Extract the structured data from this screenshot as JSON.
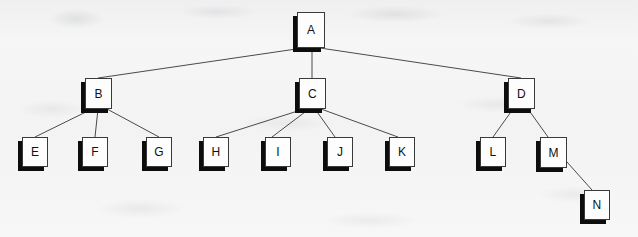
{
  "diagram": {
    "type": "node-link-tree",
    "canvas": {
      "width": 638,
      "height": 237
    },
    "style": {
      "background_color": "#f4f4f4",
      "node_fill": "#fdfdfd",
      "node_border": "#3a3a3a",
      "node_shadow": "#0d0d0d",
      "edge_color": "#4a4a4a",
      "label_color": "#111111"
    },
    "nodes": [
      {
        "id": "A",
        "label": "A",
        "x": 297,
        "y": 12,
        "w": 28,
        "h": 36,
        "level": 0
      },
      {
        "id": "B",
        "label": "B",
        "x": 85,
        "y": 78,
        "w": 27,
        "h": 31,
        "level": 1
      },
      {
        "id": "C",
        "label": "C",
        "x": 299,
        "y": 78,
        "w": 27,
        "h": 31,
        "level": 1
      },
      {
        "id": "D",
        "label": "D",
        "x": 508,
        "y": 78,
        "w": 27,
        "h": 31,
        "level": 1
      },
      {
        "id": "E",
        "label": "E",
        "x": 22,
        "y": 137,
        "w": 26,
        "h": 30,
        "level": 2
      },
      {
        "id": "F",
        "label": "F",
        "x": 82,
        "y": 137,
        "w": 26,
        "h": 30,
        "level": 2
      },
      {
        "id": "G",
        "label": "G",
        "x": 146,
        "y": 137,
        "w": 26,
        "h": 30,
        "level": 2
      },
      {
        "id": "H",
        "label": "H",
        "x": 203,
        "y": 137,
        "w": 26,
        "h": 30,
        "level": 2
      },
      {
        "id": "I",
        "label": "I",
        "x": 265,
        "y": 137,
        "w": 26,
        "h": 30,
        "level": 2
      },
      {
        "id": "J",
        "label": "J",
        "x": 327,
        "y": 137,
        "w": 26,
        "h": 30,
        "level": 2
      },
      {
        "id": "K",
        "label": "K",
        "x": 389,
        "y": 137,
        "w": 26,
        "h": 30,
        "level": 2
      },
      {
        "id": "L",
        "label": "L",
        "x": 480,
        "y": 137,
        "w": 26,
        "h": 30,
        "level": 2
      },
      {
        "id": "M",
        "label": "M",
        "x": 540,
        "y": 137,
        "w": 27,
        "h": 31,
        "level": 2
      },
      {
        "id": "N",
        "label": "N",
        "x": 584,
        "y": 190,
        "w": 26,
        "h": 30,
        "level": 3
      }
    ],
    "edges": [
      {
        "from": "A",
        "to": "B",
        "x1": 303,
        "y1": 48,
        "x2": 98,
        "y2": 78
      },
      {
        "from": "A",
        "to": "C",
        "x1": 312,
        "y1": 48,
        "x2": 312,
        "y2": 78
      },
      {
        "from": "A",
        "to": "D",
        "x1": 320,
        "y1": 48,
        "x2": 521,
        "y2": 78
      },
      {
        "from": "B",
        "to": "E",
        "x1": 92,
        "y1": 109,
        "x2": 35,
        "y2": 137
      },
      {
        "from": "B",
        "to": "F",
        "x1": 98,
        "y1": 109,
        "x2": 95,
        "y2": 137
      },
      {
        "from": "B",
        "to": "G",
        "x1": 107,
        "y1": 109,
        "x2": 159,
        "y2": 137
      },
      {
        "from": "C",
        "to": "H",
        "x1": 304,
        "y1": 109,
        "x2": 216,
        "y2": 137
      },
      {
        "from": "C",
        "to": "I",
        "x1": 309,
        "y1": 109,
        "x2": 272,
        "y2": 137
      },
      {
        "from": "C",
        "to": "J",
        "x1": 315,
        "y1": 109,
        "x2": 335,
        "y2": 137
      },
      {
        "from": "C",
        "to": "K",
        "x1": 321,
        "y1": 109,
        "x2": 398,
        "y2": 137
      },
      {
        "from": "D",
        "to": "L",
        "x1": 513,
        "y1": 109,
        "x2": 493,
        "y2": 137
      },
      {
        "from": "D",
        "to": "M",
        "x1": 528,
        "y1": 109,
        "x2": 548,
        "y2": 137
      },
      {
        "from": "M",
        "to": "N",
        "x1": 567,
        "y1": 162,
        "x2": 592,
        "y2": 190
      }
    ]
  }
}
